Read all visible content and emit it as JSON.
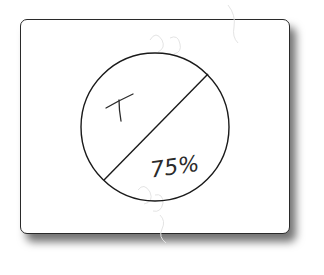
{
  "diagram": {
    "type": "split-circle",
    "labels": {
      "upper_left": "T",
      "lower_right": "75%"
    },
    "colors": {
      "stroke": "#1a1a1a",
      "card_border": "#2a2a2a",
      "background": "#ffffff"
    }
  }
}
